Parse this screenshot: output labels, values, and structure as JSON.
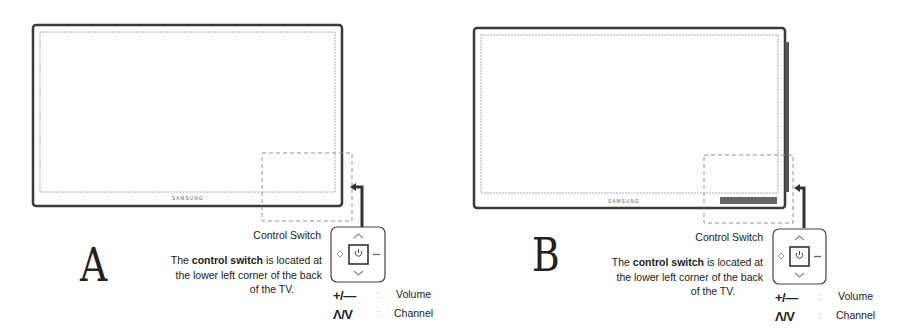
{
  "panels": [
    {
      "id": "A",
      "letter": "A",
      "brand": "SAMSUNG",
      "control_switch_label": "Control Switch",
      "description": {
        "prefix": "The ",
        "bold": "control switch",
        "suffix": " is located at the lower left corner of the back",
        "last_line": "of the TV."
      },
      "legend": [
        {
          "symbol": "+/—",
          "separator": ":",
          "label": "Volume"
        },
        {
          "symbol": "Λ/V",
          "separator": ":",
          "label": "Channel"
        }
      ],
      "has_side_stand": false
    },
    {
      "id": "B",
      "letter": "B",
      "brand": "SAMSUNG",
      "control_switch_label": "Control Switch",
      "description": {
        "prefix": "The ",
        "bold": "control switch",
        "suffix": " is located at the lower left corner of the back",
        "last_line": "of the TV."
      },
      "legend": [
        {
          "symbol": "+/—",
          "separator": ":",
          "label": "Volume"
        },
        {
          "symbol": "Λ/V",
          "separator": ":",
          "label": "Channel"
        }
      ],
      "has_side_stand": true
    }
  ],
  "icons": {
    "control_pad": "control-switch-pad-icon",
    "power": "power-icon",
    "up": "chevron-up-icon",
    "down": "chevron-down-icon",
    "left": "source-icon",
    "right": "minus-icon"
  }
}
